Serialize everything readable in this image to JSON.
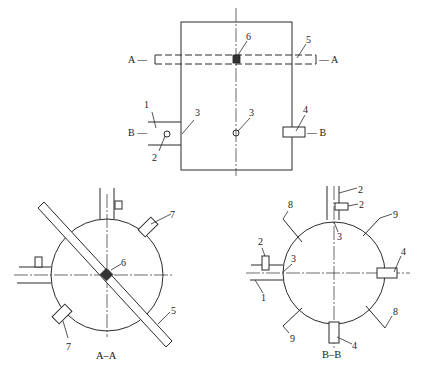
{
  "diagram": {
    "type": "engineering drawing — tank/vessel section views with numbered parts",
    "views": [
      {
        "name": "elevation",
        "section_markers": [
          "A",
          "B"
        ]
      },
      {
        "name": "section-a-a",
        "caption": "A–A"
      },
      {
        "name": "section-b-b",
        "caption": "B–B"
      }
    ]
  },
  "elevation": {
    "section_a_left": "A —",
    "section_a_right": "— A",
    "section_b_left": "B —",
    "section_b_right": "— B",
    "labels": {
      "n1": "1",
      "n2": "2",
      "n3_left": "3",
      "n3_center": "3",
      "n4": "4",
      "n5": "5",
      "n6": "6"
    }
  },
  "section_aa": {
    "caption": "A–A",
    "labels": {
      "n5": "5",
      "n6": "6",
      "n7_top": "7",
      "n7_bottom": "7"
    }
  },
  "section_bb": {
    "caption": "B–B",
    "labels": {
      "n1": "1",
      "n2_left": "2",
      "n2_top_pipe": "2",
      "n2_top_box": "2",
      "n3_left": "3",
      "n3_top": "3",
      "n4_right": "4",
      "n4_bottom": "4",
      "n8_top": "8",
      "n8_bottom": "8",
      "n9_top": "9",
      "n9_bottom": "9"
    }
  },
  "colors": {
    "line": "#2b2b2b",
    "fill_solid": "#333333",
    "background": "#ffffff"
  }
}
